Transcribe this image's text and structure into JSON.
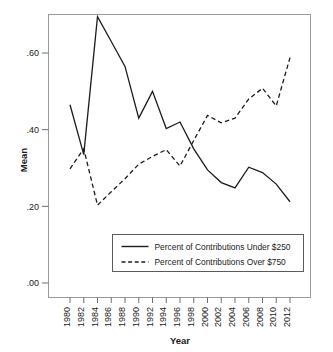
{
  "chart_data": {
    "type": "line",
    "title": "",
    "xlabel": "Year",
    "ylabel": "Mean",
    "xlim": [
      1980,
      2012
    ],
    "ylim": [
      0.0,
      0.72
    ],
    "grid": false,
    "legend_position": "inside-bottom-center",
    "y_ticks": [
      ".00",
      ".20",
      ".40",
      ".60"
    ],
    "y_tick_values": [
      0.0,
      0.2,
      0.4,
      0.6
    ],
    "x_ticks": [
      "1980",
      "1982",
      "1984",
      "1986",
      "1988",
      "1990",
      "1992",
      "1994",
      "1996",
      "1998",
      "2000",
      "2002",
      "2004",
      "2006",
      "2008",
      "2010",
      "2012"
    ],
    "x": [
      1980,
      1982,
      1984,
      1986,
      1988,
      1990,
      1992,
      1994,
      1996,
      1998,
      2000,
      2002,
      2004,
      2006,
      2008,
      2010,
      2012
    ],
    "series": [
      {
        "name": "Percent of Contributions Under $250",
        "style": "solid",
        "color": "#1c1c1c",
        "values": [
          0.465,
          0.335,
          0.695,
          0.63,
          0.565,
          0.43,
          0.5,
          0.403,
          0.42,
          0.35,
          0.295,
          0.262,
          0.248,
          0.302,
          0.288,
          0.258,
          0.212
        ]
      },
      {
        "name": "Percent of Contributions Over $750",
        "style": "dashed",
        "color": "#1c1c1c",
        "values": [
          0.298,
          0.35,
          0.203,
          0.238,
          0.272,
          0.31,
          0.33,
          0.348,
          0.305,
          0.372,
          0.437,
          0.418,
          0.43,
          0.48,
          0.508,
          0.462,
          0.588
        ]
      }
    ]
  },
  "legend": {
    "entries": [
      {
        "label": "Percent of Contributions Under $250",
        "style": "solid"
      },
      {
        "label": "Percent of Contributions Over $750",
        "style": "dashed"
      }
    ]
  },
  "axis": {
    "y_title": "Mean",
    "x_title": "Year"
  },
  "colors": {
    "line": "#1c1c1c",
    "frame": "#9a9a9a",
    "background": "#ffffff"
  }
}
